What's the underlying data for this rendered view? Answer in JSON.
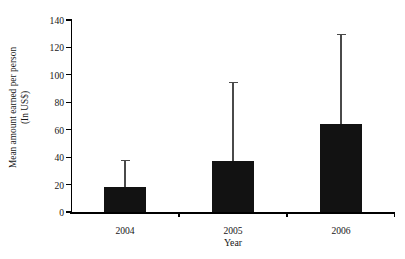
{
  "chart_data": {
    "type": "bar",
    "title": "",
    "subtitle": "",
    "xlabel": "Year",
    "ylabel": "Mean amount earned per person (In US$)",
    "ylabel_line1": "Mean amount earned per person",
    "ylabel_line2": "(In US$)",
    "categories": [
      "2004",
      "2005",
      "2006"
    ],
    "values": [
      18,
      37,
      64
    ],
    "error_upper": [
      38,
      95,
      130
    ],
    "ylim": [
      0,
      140
    ],
    "yticks": [
      0,
      20,
      40,
      60,
      80,
      100,
      120,
      140
    ],
    "ytick_labels": [
      "0",
      "20",
      "40",
      "60",
      "80",
      "100",
      "120",
      "140"
    ],
    "grid": false,
    "legend": null,
    "bar_color": "#121212",
    "error_bar_color": "#4a4a4a",
    "axis_color": "#000000",
    "background_color": "#ffffff",
    "error_bars": "upper-only",
    "series": [
      {
        "name": "Mean amount earned per person (In US$)",
        "values": [
          18,
          37,
          64
        ],
        "error_upper": [
          38,
          95,
          130
        ]
      }
    ],
    "annotations": []
  }
}
